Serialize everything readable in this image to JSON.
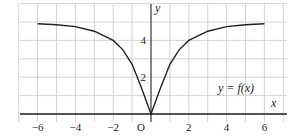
{
  "chart_data": {
    "type": "line",
    "title": "",
    "xlabel": "x",
    "ylabel": "y",
    "annotation": "y = f(x)",
    "origin_label": "O",
    "xlim": [
      -7,
      7
    ],
    "ylim": [
      0,
      6
    ],
    "grid": true,
    "x_ticks": [
      "−6",
      "−4",
      "−2",
      "2",
      "4",
      "6"
    ],
    "y_ticks": [
      "2",
      "4"
    ],
    "series": [
      {
        "name": "y = f(x)",
        "x": [
          -6,
          -5,
          -4,
          -3,
          -2,
          -1.5,
          -1,
          -0.5,
          0,
          0.5,
          1,
          1.5,
          2,
          3,
          4,
          5,
          6
        ],
        "values": [
          4.9,
          4.85,
          4.75,
          4.5,
          4.0,
          3.5,
          2.7,
          1.4,
          0,
          1.4,
          2.7,
          3.5,
          4.0,
          4.5,
          4.75,
          4.85,
          4.9
        ]
      }
    ]
  }
}
